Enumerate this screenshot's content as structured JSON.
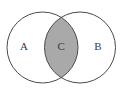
{
  "figure": {
    "background_color": "#ffffff",
    "width": 123,
    "height": 94
  },
  "chart_data": {
    "type": "diagram",
    "diagram_kind": "venn",
    "title": "",
    "xlabel": "",
    "ylabel": "",
    "sets": [
      {
        "id": "set-a",
        "label": "A",
        "cx": 42.5,
        "cy": 47.5,
        "r": 35.5,
        "fill": "#ffffff",
        "stroke": "#4a4a4a",
        "stroke_width": 1,
        "label_x": 24,
        "label_y": 47
      },
      {
        "id": "set-b",
        "label": "B",
        "cx": 80,
        "cy": 47.5,
        "r": 35.5,
        "fill": "#ffffff",
        "stroke": "#4a4a4a",
        "stroke_width": 1,
        "label_x": 98,
        "label_y": 47
      }
    ],
    "intersection": {
      "id": "set-c",
      "label": "C",
      "fill": "#a9a9a9",
      "stroke": "#4a4a4a",
      "stroke_width": 1,
      "label_x": 61.2,
      "label_y": 47,
      "label_color": "#3a3a3a"
    },
    "legend": [],
    "annotations": []
  },
  "labels": {
    "left_set": "A",
    "intersection": "C",
    "right_set": "B"
  },
  "colors": {
    "background": "#ffffff",
    "outline": "#4a4a4a",
    "intersection_fill": "#a9a9a9",
    "text": "#3a3a3a"
  }
}
